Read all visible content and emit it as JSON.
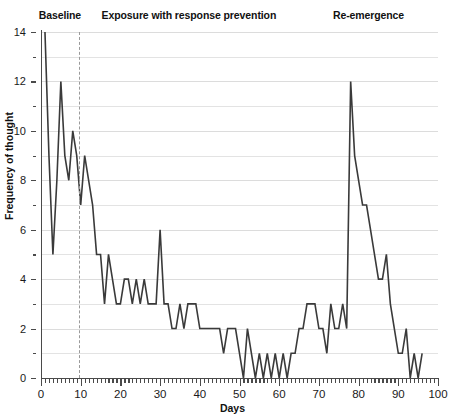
{
  "chart_data": {
    "type": "line",
    "title": "",
    "xlabel": "Days",
    "ylabel": "Frequency of thought",
    "xlim": [
      0,
      100
    ],
    "ylim": [
      0,
      14
    ],
    "x_major_step": 10,
    "x_minor_step": 1,
    "y_major_step": 2,
    "y_minor_step": 1,
    "grid": "horizontal",
    "legend": "none",
    "phases": [
      {
        "label": "Baseline",
        "start": 0,
        "end": 9.5
      },
      {
        "label": "Exposure with response prevention",
        "start": 9.5,
        "end": 65
      },
      {
        "label": "Re-emergence",
        "start": 65,
        "end": 100
      }
    ],
    "phase_dividers": [
      9.5
    ],
    "series": [
      {
        "name": "Frequency of thought",
        "color": "#3a3a3a",
        "x": [
          1,
          2,
          3,
          4,
          5,
          6,
          7,
          8,
          9,
          10,
          11,
          12,
          13,
          14,
          15,
          16,
          17,
          18,
          19,
          20,
          21,
          22,
          23,
          24,
          25,
          26,
          27,
          28,
          29,
          30,
          31,
          32,
          33,
          34,
          35,
          36,
          37,
          38,
          39,
          40,
          41,
          42,
          43,
          44,
          45,
          46,
          47,
          48,
          49,
          50,
          51,
          52,
          53,
          54,
          55,
          56,
          57,
          58,
          59,
          60,
          61,
          62,
          63,
          64,
          65,
          66,
          67,
          68,
          69,
          70,
          71,
          72,
          73,
          74,
          75,
          76,
          77,
          78,
          79,
          80,
          81,
          82,
          83,
          84,
          85,
          86,
          87,
          88,
          89,
          90,
          91,
          92,
          93,
          94,
          95,
          96
        ],
        "values": [
          14,
          9,
          5,
          8,
          12,
          9,
          8,
          10,
          9,
          7,
          9,
          8,
          7,
          5,
          5,
          3,
          5,
          4,
          3,
          3,
          4,
          4,
          3,
          4,
          3,
          4,
          3,
          3,
          3,
          6,
          3,
          3,
          2,
          2,
          3,
          2,
          3,
          3,
          3,
          2,
          2,
          2,
          2,
          2,
          2,
          1,
          2,
          2,
          2,
          1,
          0,
          2,
          1,
          0,
          1,
          0,
          1,
          0,
          1,
          0,
          1,
          0,
          1,
          1,
          2,
          2,
          3,
          3,
          3,
          2,
          2,
          1,
          3,
          2,
          2,
          3,
          2,
          12,
          9,
          8,
          7,
          7,
          6,
          5,
          4,
          4,
          5,
          3,
          2,
          1,
          1,
          2,
          0,
          1,
          0,
          1
        ]
      }
    ]
  }
}
